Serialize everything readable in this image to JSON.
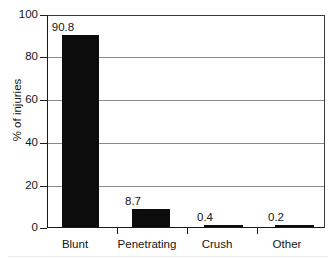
{
  "chart_data": {
    "type": "bar",
    "title": "",
    "subtitle": "",
    "xlabel": "",
    "ylabel": "% of injuries",
    "categories": [
      "Blunt",
      "Penetrating",
      "Crush",
      "Other"
    ],
    "values": [
      90.8,
      8.7,
      0.4,
      0.2
    ],
    "value_labels": [
      "90.8",
      "8.7",
      "0.4",
      "0.2"
    ],
    "ylim": [
      0,
      100
    ],
    "yticks": [
      0,
      20,
      40,
      60,
      80,
      100
    ],
    "ytick_labels": [
      "0",
      "20",
      "40",
      "60",
      "80",
      "100"
    ],
    "grid": "horizontal",
    "legend": "none",
    "series": [
      {
        "name": "% of injuries",
        "color": "#0c0c0c",
        "values": [
          90.8,
          8.7,
          0.4,
          0.2
        ]
      }
    ],
    "annotations": []
  },
  "axis": {
    "y_title": "% of injuries",
    "ticks": {
      "y0": "0",
      "y20": "20",
      "y40": "40",
      "y60": "60",
      "y80": "80",
      "y100": "100"
    }
  },
  "categories": {
    "c0": "Blunt",
    "c1": "Penetrating",
    "c2": "Crush",
    "c3": "Other"
  },
  "values": {
    "v0": "90.8",
    "v1": "8.7",
    "v2": "0.4",
    "v3": "0.2"
  },
  "colors": {
    "bar": "#0c0c0c",
    "axis": "#1a1a1a",
    "grid": "#8a8a8a",
    "background": "#ffffff",
    "text": "#151515"
  }
}
